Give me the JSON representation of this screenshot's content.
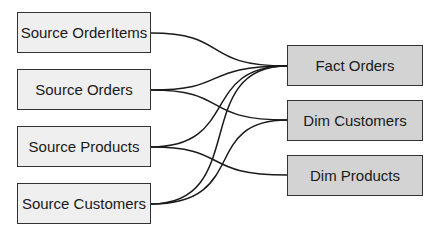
{
  "diagram": {
    "sources": [
      {
        "id": "src-orderitems",
        "label": "Source OrderItems"
      },
      {
        "id": "src-orders",
        "label": "Source Orders"
      },
      {
        "id": "src-products",
        "label": "Source Products"
      },
      {
        "id": "src-customers",
        "label": "Source Customers"
      }
    ],
    "targets": [
      {
        "id": "fact-orders",
        "label": "Fact Orders"
      },
      {
        "id": "dim-customers",
        "label": "Dim Customers"
      },
      {
        "id": "dim-products",
        "label": "Dim Products"
      }
    ],
    "edges": [
      {
        "from": "Source OrderItems",
        "to": "Fact Orders"
      },
      {
        "from": "Source Orders",
        "to": "Fact Orders"
      },
      {
        "from": "Source Orders",
        "to": "Dim Customers"
      },
      {
        "from": "Source Products",
        "to": "Fact Orders"
      },
      {
        "from": "Source Products",
        "to": "Dim Products"
      },
      {
        "from": "Source Customers",
        "to": "Fact Orders"
      },
      {
        "from": "Source Customers",
        "to": "Dim Customers"
      }
    ],
    "colors": {
      "source_fill": "#efefef",
      "target_fill": "#d3d3d3",
      "border": "#333333",
      "edge": "#1a1a1a"
    }
  }
}
